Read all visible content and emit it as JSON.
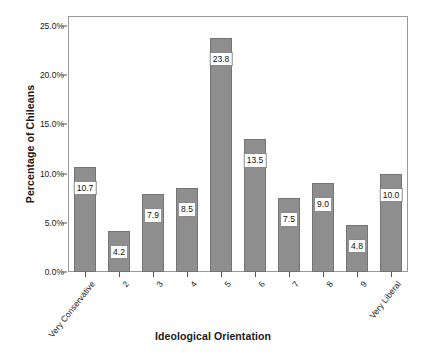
{
  "chart_data": {
    "type": "bar",
    "title": "",
    "xlabel": "Ideological Orientation",
    "ylabel": "Percentage of Chileans",
    "categories": [
      "Very Conservative",
      "2",
      "3",
      "4",
      "5",
      "6",
      "7",
      "8",
      "9",
      "Very Liberal"
    ],
    "values": [
      10.7,
      4.2,
      7.9,
      8.5,
      23.8,
      13.5,
      7.5,
      9.0,
      4.8,
      10.0
    ],
    "data_labels": [
      "10.7",
      "4.2",
      "7.9",
      "8.5",
      "23.8",
      "13.5",
      "7.5",
      "9.0",
      "4.8",
      "10.0"
    ],
    "ylim": [
      0.0,
      26.0
    ],
    "ytick_values": [
      0.0,
      5.0,
      10.0,
      15.0,
      20.0,
      25.0
    ],
    "ytick_labels": [
      "0.0%",
      "5.0%",
      "10.0%",
      "15.0%",
      "20.0%",
      "25.0%"
    ],
    "grid": false,
    "legend": null,
    "bar_color": "#8e8e8e",
    "bar_edge_color": "#757575",
    "plot_border_color": "#9a9a9a",
    "background_color": "#ffffff",
    "text_color": "#1a1a1a"
  }
}
